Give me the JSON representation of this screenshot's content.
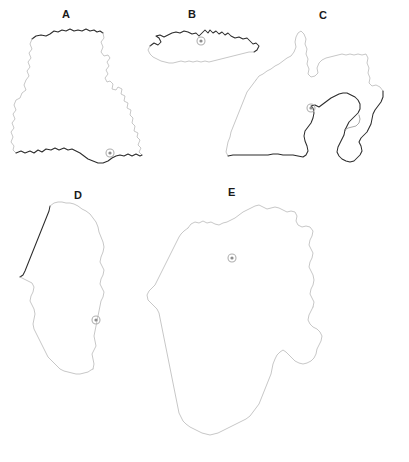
{
  "figure": {
    "type": "map-panel-figure",
    "background_color": "#ffffff",
    "width": 409,
    "height": 462,
    "panel_count": 5,
    "coast_color": "#2b2b2b",
    "inland_border_color": "#b9b9b9",
    "capital_marker_color": "#8d8d8d",
    "label_color": "#1a1a1a"
  },
  "panels": [
    {
      "id": "A",
      "label": "A",
      "label_x": 62,
      "label_y": 15,
      "capital_marker_x": 110,
      "capital_marker_y": 153,
      "capital_marker_radius": 4
    },
    {
      "id": "B",
      "label": "B",
      "label_x": 190,
      "label_y": 15,
      "capital_marker_x": 201,
      "capital_marker_y": 41,
      "capital_marker_radius": 4
    },
    {
      "id": "C",
      "label": "C",
      "label_x": 322,
      "label_y": 16,
      "capital_marker_x": 311,
      "capital_marker_y": 108,
      "capital_marker_radius": 4
    },
    {
      "id": "D",
      "label": "D",
      "label_x": 78,
      "label_y": 196,
      "capital_marker_x": 96,
      "capital_marker_y": 320,
      "capital_marker_radius": 4
    },
    {
      "id": "E",
      "label": "E",
      "label_x": 231,
      "label_y": 193,
      "capital_marker_x": 232,
      "capital_marker_y": 258,
      "capital_marker_radius": 4
    }
  ]
}
